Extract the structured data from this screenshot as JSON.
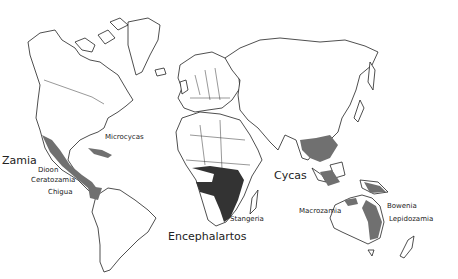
{
  "map": {
    "title": "",
    "genera_labels": [
      {
        "id": "zamia",
        "text": "Zamia",
        "x": 2,
        "y": 159,
        "size": "big"
      },
      {
        "id": "dioon",
        "text": "Dioon",
        "x": 38,
        "y": 171,
        "size": "small"
      },
      {
        "id": "ceratozamia",
        "text": "Ceratozamia",
        "x": 31,
        "y": 180,
        "size": "small"
      },
      {
        "id": "chigua",
        "text": "Chigua",
        "x": 48,
        "y": 192,
        "size": "small"
      },
      {
        "id": "microcycas",
        "text": "Microcycas",
        "x": 105,
        "y": 136,
        "size": "small"
      },
      {
        "id": "cycas",
        "text": "Cycas",
        "x": 275,
        "y": 176,
        "size": "big"
      },
      {
        "id": "stangeria",
        "text": "Stangeria",
        "x": 230,
        "y": 217,
        "size": "small"
      },
      {
        "id": "encephalartos",
        "text": "Encephalartos",
        "x": 168,
        "y": 236,
        "size": "big"
      },
      {
        "id": "macrozamia",
        "text": "Macrozamia",
        "x": 299,
        "y": 209,
        "size": "small"
      },
      {
        "id": "bowenia",
        "text": "Bowenia",
        "x": 387,
        "y": 203,
        "size": "small"
      },
      {
        "id": "lepidozamia",
        "text": "Lepidozamia",
        "x": 389,
        "y": 217,
        "size": "small"
      }
    ],
    "shading": {
      "light_color": "#707070",
      "dark_color": "#333333"
    }
  }
}
